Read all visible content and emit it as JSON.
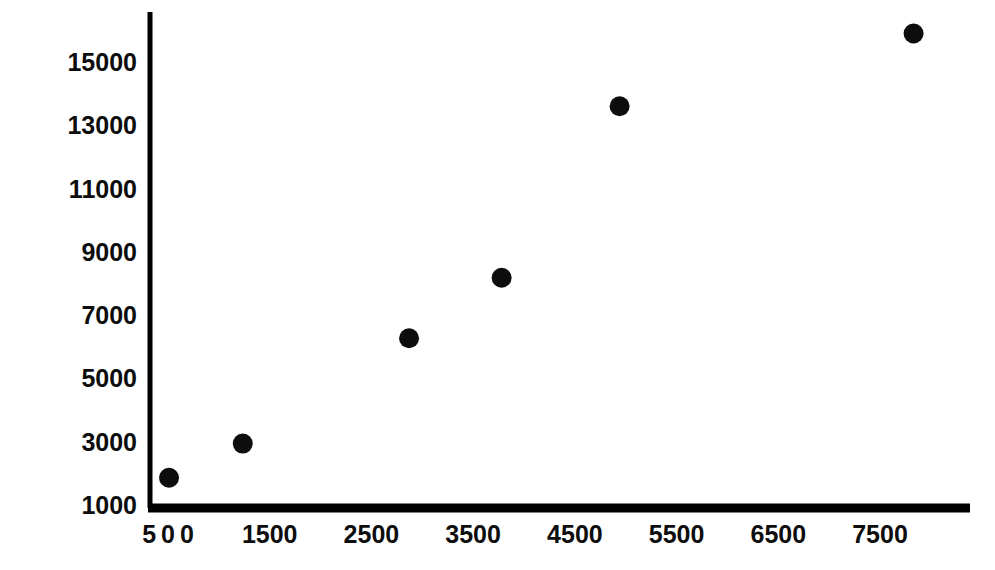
{
  "chart_data": {
    "type": "scatter",
    "title": "",
    "subtitle": "",
    "xlabel": "",
    "ylabel": "",
    "grid": false,
    "legend": null,
    "marker": {
      "shape": "filled-circle",
      "color": "#0d0d0d",
      "radius_px": 10
    },
    "axis_color": "#000000",
    "xlim": [
      400,
      8600
    ],
    "ylim": [
      1000,
      16800
    ],
    "xticks": [
      500,
      1500,
      2500,
      3500,
      4500,
      5500,
      6500,
      7500
    ],
    "xtick_labels": [
      "500",
      "1500",
      "2500",
      "3500",
      "4500",
      "5500",
      "6500",
      "7500"
    ],
    "yticks": [
      1000,
      3000,
      5000,
      7000,
      9000,
      11000,
      13000,
      15000
    ],
    "ytick_labels": [
      "1000",
      "3000",
      "5000",
      "7000",
      "9000",
      "11000",
      "13000",
      "15000"
    ],
    "x": [
      510,
      1235,
      2870,
      3780,
      4940,
      7830
    ],
    "y": [
      1860,
      2940,
      6270,
      8180,
      13600,
      15900
    ],
    "points": [
      {
        "x": 510,
        "y": 1860
      },
      {
        "x": 1235,
        "y": 2940
      },
      {
        "x": 2870,
        "y": 6270
      },
      {
        "x": 3780,
        "y": 8180
      },
      {
        "x": 4940,
        "y": 13600
      },
      {
        "x": 7830,
        "y": 15900
      }
    ]
  }
}
